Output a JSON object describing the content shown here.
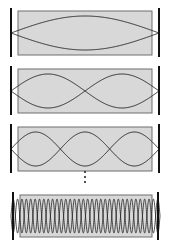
{
  "figure": {
    "title": "Standing wave modes in a one-dimensional box",
    "width": 170,
    "height": 243,
    "background": "#ffffff",
    "box_fill": "#d8d8d8",
    "box_stroke": "#6e6e6e",
    "wave_stroke": "#2b2b2b",
    "wall_color": "#111111",
    "ellipsis_color": "#1a1a1a"
  },
  "panels": [
    {
      "id": "panel-mode-1",
      "mode_label": "n = 1",
      "harmonic": 1,
      "antinodes": 1,
      "nodes": 2,
      "box": {
        "x": 18,
        "y": 11,
        "width": 134,
        "height": 44
      },
      "walls": [
        {
          "x": 11,
          "y_top": 8,
          "y_bottom": 57
        },
        {
          "x": 159,
          "y_top": 8,
          "y_bottom": 57
        }
      ],
      "wave": {
        "x_start": 11,
        "x_end": 159,
        "center_y": 33,
        "amplitude": 17,
        "half_cycles": 1
      }
    },
    {
      "id": "panel-mode-2",
      "mode_label": "n = 2",
      "harmonic": 2,
      "antinodes": 2,
      "nodes": 3,
      "box": {
        "x": 18,
        "y": 69,
        "width": 134,
        "height": 44
      },
      "walls": [
        {
          "x": 11,
          "y_top": 66,
          "y_bottom": 115
        },
        {
          "x": 159,
          "y_top": 66,
          "y_bottom": 115
        }
      ],
      "wave": {
        "x_start": 11,
        "x_end": 159,
        "center_y": 91,
        "amplitude": 17,
        "half_cycles": 2
      }
    },
    {
      "id": "panel-mode-3",
      "mode_label": "n = 3",
      "harmonic": 3,
      "antinodes": 3,
      "nodes": 4,
      "box": {
        "x": 18,
        "y": 127,
        "width": 134,
        "height": 44
      },
      "walls": [
        {
          "x": 11,
          "y_top": 124,
          "y_bottom": 173
        },
        {
          "x": 159,
          "y_top": 124,
          "y_bottom": 173
        }
      ],
      "wave": {
        "x_start": 11,
        "x_end": 159,
        "center_y": 149,
        "amplitude": 17,
        "half_cycles": 3
      }
    },
    {
      "id": "panel-mode-high",
      "mode_label": "n large",
      "harmonic": 34,
      "antinodes": 34,
      "nodes": 35,
      "box": {
        "x": 20,
        "y": 195,
        "width": 132,
        "height": 42
      },
      "walls": [
        {
          "x": 13,
          "y_top": 192,
          "y_bottom": 240
        },
        {
          "x": 158,
          "y_top": 192,
          "y_bottom": 240
        }
      ],
      "wave": {
        "x_start": 11,
        "x_end": 160,
        "center_y": 216,
        "amplitude": 17,
        "half_cycles": 34
      }
    }
  ],
  "ellipsis": {
    "id": "vertical-ellipsis",
    "symbol": "vertical-ellipsis",
    "dot_count": 3,
    "x": 84,
    "y_top": 171,
    "y_bottom": 183
  }
}
